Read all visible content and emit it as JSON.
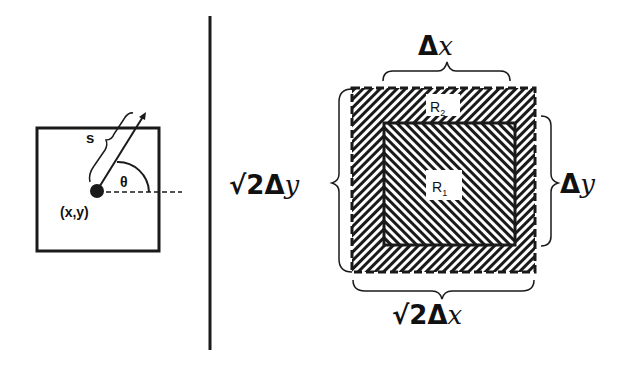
{
  "left_panel": {
    "label_s": "s",
    "label_theta": "θ",
    "label_point": "(x,y)"
  },
  "right_panel": {
    "label_top": "Δx",
    "label_top_delta": "Δ",
    "label_top_var": "x",
    "label_right_delta": "Δ",
    "label_right_var": "y",
    "label_left_prefix": "√2Δ",
    "label_left_var": "y",
    "label_bottom_prefix": "√2Δ",
    "label_bottom_var": "x",
    "inner_region": "R",
    "inner_region_sub": "1",
    "outer_region": "R",
    "outer_region_sub": "2"
  },
  "colors": {
    "ink": "#1a1a1a",
    "background": "#ffffff"
  }
}
